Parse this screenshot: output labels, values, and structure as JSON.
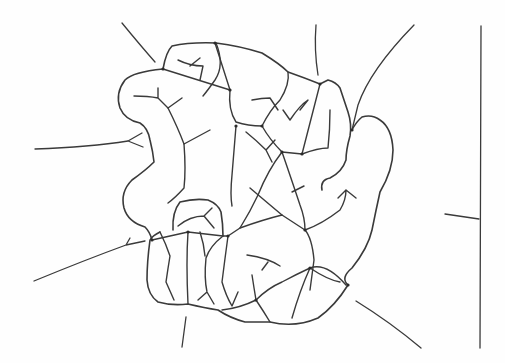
{
  "figure": {
    "stroke_color": "#3a3a3a",
    "background_color": "#fefefe",
    "labels": []
  }
}
